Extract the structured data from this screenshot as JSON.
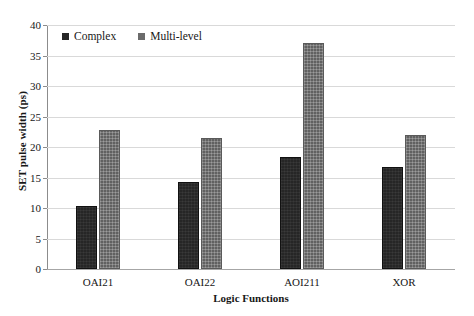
{
  "chart_data": {
    "type": "bar",
    "title": "",
    "xlabel": "Logic Functions",
    "ylabel": "SET pulse width (ps)",
    "categories": [
      "OAI21",
      "OAI22",
      "AOI211",
      "XOR"
    ],
    "series": [
      {
        "name": "Complex",
        "color": "#262626",
        "values": [
          10.3,
          14.3,
          18.3,
          16.8
        ]
      },
      {
        "name": "Multi-level",
        "color": "#616161",
        "values": [
          22.8,
          21.4,
          37.0,
          22.0
        ]
      }
    ],
    "ylim": [
      0,
      40
    ],
    "yticks": [
      0,
      5,
      10,
      15,
      20,
      25,
      30,
      35,
      40
    ],
    "ytick_labels": [
      "0",
      "5",
      "10",
      "15",
      "20",
      "25",
      "30",
      "35",
      "40"
    ],
    "grid": true,
    "legend_position": "top-left-inside"
  }
}
